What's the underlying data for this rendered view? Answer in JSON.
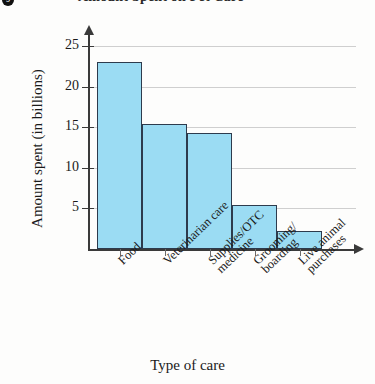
{
  "figure": {
    "marker_label": "9",
    "title": "Amount Spent on Pet Care"
  },
  "chart_data": {
    "type": "bar",
    "title": "Amount Spent on Pet Care",
    "xlabel": "Type of care",
    "ylabel": "Amount spent (in billions)",
    "categories": [
      "Food",
      "Veterinarian care",
      "Supplies/OTC medicine",
      "Grooming/ boarding",
      "Live animal purchases"
    ],
    "category_lines": [
      [
        "Food"
      ],
      [
        "Veterinarian care"
      ],
      [
        "Supplies/OTC",
        "medicine"
      ],
      [
        "Grooming/",
        "boarding"
      ],
      [
        "Live animal",
        "purchases"
      ]
    ],
    "values": [
      23.0,
      15.4,
      14.3,
      5.4,
      2.2
    ],
    "ylim": [
      0,
      26.5
    ],
    "yticks": [
      5,
      10,
      15,
      20,
      25
    ],
    "ytick_labels": [
      "5",
      "10",
      "15",
      "20",
      "25"
    ],
    "grid": true,
    "legend": "none",
    "bar_fill_color": "#9bdcf3",
    "bar_edge_color": "#2d3b4d",
    "axis_color": "#3a3a3a",
    "gridline_color": "#cfcfcf"
  }
}
